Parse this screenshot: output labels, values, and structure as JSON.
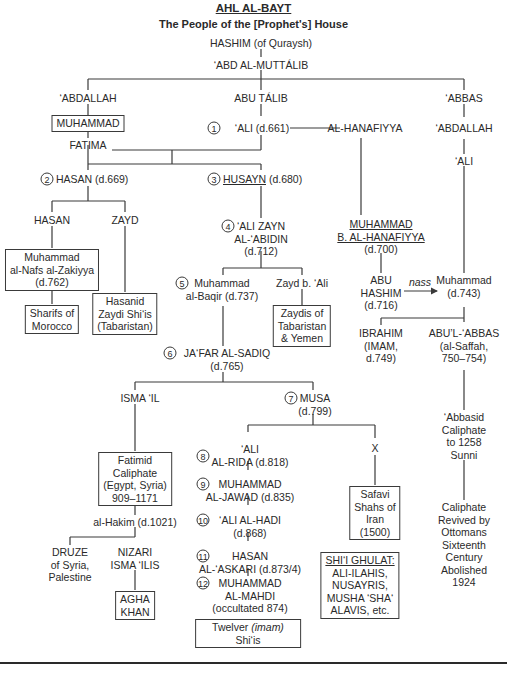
{
  "title": "AHL AL-BAYT",
  "subtitle": "The People of the [Prophet's] House",
  "nodes": {
    "hashim": "HASHIM (of Quraysh)",
    "abd_al_muttalib": "‘ABD AL-MUTTÁLIB",
    "abdallah": "‘ABDALLAH",
    "abu_talib": "ABU TÁLIB",
    "abbas": "‘ABBAS",
    "muhammad_prophet": "MUHAMMAD",
    "ali_name": "‘ALI (d.661)",
    "ali_num": "1",
    "al_hanafiyya": "AL-HANAFIYYA",
    "abbas_abdallah": "‘ABDALLAH",
    "fatima": "FATIMA",
    "abbas_ali": "‘ALI",
    "hasan_num": "2",
    "hasan_name": "HASAN (d.669)",
    "husayn_num": "3",
    "husayn_name": "HUSAYN",
    "husayn_date": " (d.680)",
    "hasan2": "HASAN",
    "zayd": "ZAYD",
    "zayn_num": "4",
    "zayn_line1": "‘ALI ZAYN",
    "zayn_line2": "AL-‘ABIDIN",
    "zayn_line3": "(d.712)",
    "ibn_hanafiyya_line1": "MUHAMMAD",
    "ibn_hanafiyya_line2": "B. AL-HANAFIYYA",
    "ibn_hanafiyya_line3": "(d.700)",
    "nafs_line1": "Muhammad",
    "nafs_line2": "al-Nafs al-Zakiyya",
    "nafs_line3": "(d.762)",
    "baqir_num": "5",
    "baqir_line1": "Muhammad",
    "baqir_line2": "al-Baqir (d.737)",
    "zayd_b_ali": "Zayd b. ‘Ali",
    "hasanid_line1": "Hasanid",
    "hasanid_line2": "Zaydi Shi‘is",
    "hasanid_line3": "(Tabaristan)",
    "sharifs_line1": "Sharifs of",
    "sharifs_line2": "Morocco",
    "zaydis_line1": "Zaydis of",
    "zaydis_line2": "Tabaristan",
    "zaydis_line3": "& Yemen",
    "abu_hashim_line1": "ABU",
    "abu_hashim_line2": "HASHIM",
    "abu_hashim_line3": "(d.716)",
    "nass": "nass",
    "muh743_line1": "Muhammad",
    "muh743_line2": "(d.743)",
    "ibrahim_line1": "IBRAHIM",
    "ibrahim_line2": "(IMAM,",
    "ibrahim_line3": "d.749)",
    "saffah_line1": "ABU’L-‘ABBAS",
    "saffah_line2": "(al-Saffah,",
    "saffah_line3": "750–754)",
    "jafar_num": "6",
    "jafar_line1": "JA‘FAR AL-SADIQ",
    "jafar_line2": "(d.765)",
    "ismail": "ISMA ‘IL",
    "musa_num": "7",
    "musa_line1": "MUSA",
    "musa_line2": "(d.799)",
    "abbasid_line1": "‘Abbasid",
    "abbasid_line2": "Caliphate",
    "abbasid_line3": "to 1258",
    "abbasid_line4": "Sunni",
    "fatimid_line1": "Fatimid",
    "fatimid_line2": "Caliphate",
    "fatimid_line3": "(Egypt, Syria)",
    "fatimid_line4": "909–1171",
    "rida_num": "8",
    "rida_line1": "‘ALI",
    "rida_line2": "AL-RIDA (d.818)",
    "x": "X",
    "jawad_num": "9",
    "jawad_line1": "MUHAMMAD",
    "jawad_line2": "AL-JAWAD (d.835)",
    "safavi_line1": "Safavi",
    "safavi_line2": "Shahs of",
    "safavi_line3": "Iran",
    "safavi_line4": "(1500)",
    "hakim": "al-Hakim (d.1021)",
    "hadi_num": "10",
    "hadi_line1": "‘ALI AL-HADI",
    "hadi_line2": "(d.868)",
    "ottoman_line1": "Caliphate",
    "ottoman_line2": "Revived by",
    "ottoman_line3": "Ottomans",
    "ottoman_line4": "Sixteenth",
    "ottoman_line5": "Century",
    "ottoman_line6": "Abolished",
    "ottoman_line7": "1924",
    "druze_line1": "DRUZE",
    "druze_line2": "of Syria,",
    "druze_line3": "Palestine",
    "nizari_line1": "NIZARI",
    "nizari_line2": "ISMA ‘ILIS",
    "askari_num": "11",
    "askari_line1": "HASAN",
    "askari_line2": "AL-‘ASKARI (d.873/4)",
    "ghulat_line1": "SHI‘I GHULAT:",
    "ghulat_line2": "ALI-ILAHIS,",
    "ghulat_line3": "NUSAYRIS,",
    "ghulat_line4": "MUSHA ‘SHA‘",
    "ghulat_line5": "ALAVIS, etc.",
    "agha_line1": "AGHA",
    "agha_line2": "KHAN",
    "mahdi_num": "12",
    "mahdi_line1": "MUHAMMAD",
    "mahdi_line2": "AL-MAHDI",
    "mahdi_line3": "(occultated 874)",
    "twelver_pre": "Twelver ",
    "twelver_italic": "(imam)",
    "twelver_line2": "Shi‘is"
  }
}
